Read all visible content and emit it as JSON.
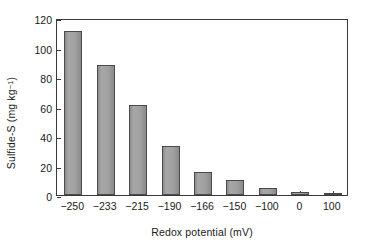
{
  "chart_data": {
    "type": "bar",
    "title": "",
    "xlabel": "Redox potential (mV)",
    "ylabel_text": "Sulfide-S (mg kg",
    "ylabel_sup": "−1",
    "ylabel_tail": ")",
    "ylabel_full": "Sulfide-S (mg kg⁻¹)",
    "categories": [
      "−250",
      "−233",
      "−215",
      "−190",
      "−166",
      "−150",
      "−100",
      "0",
      "100"
    ],
    "values": [
      111,
      88,
      61,
      33.5,
      15.5,
      10.5,
      4.5,
      2,
      0.5
    ],
    "ylim": [
      0,
      120
    ],
    "yticks": [
      0,
      20,
      40,
      60,
      80,
      100,
      120
    ],
    "ytick_labels": [
      "0",
      "20",
      "40",
      "60",
      "80",
      "100",
      "120"
    ],
    "grid": false,
    "legend": "none",
    "bar_color": "#9a9a9a",
    "bar_edge_color": "#4a4a4a",
    "axis_color": "#3a3a3a",
    "background": "#ffffff"
  }
}
